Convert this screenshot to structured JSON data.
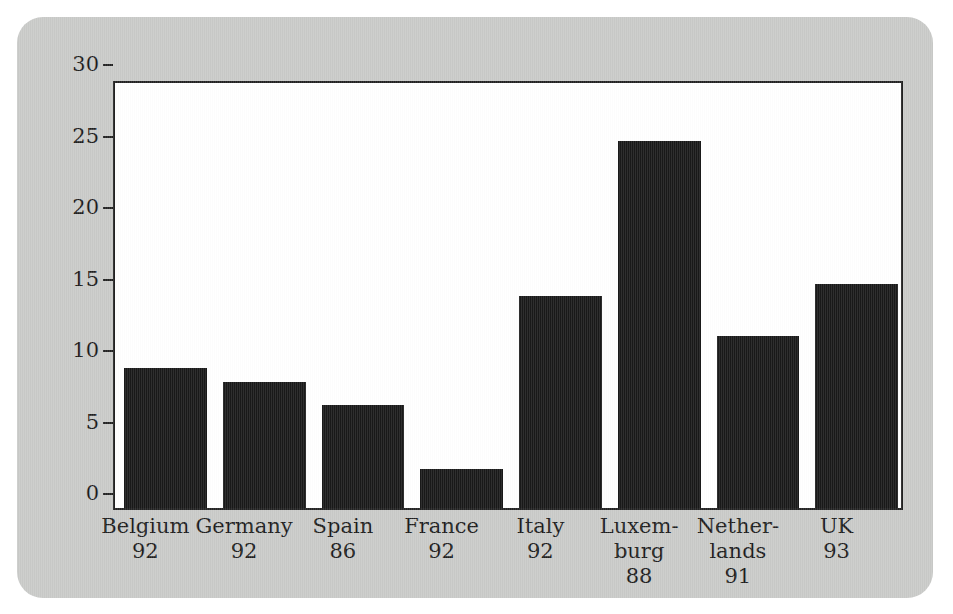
{
  "chart_data": {
    "type": "bar",
    "title": "",
    "xlabel": "",
    "ylabel": "",
    "ylim": [
      0,
      30
    ],
    "yticks": [
      0,
      5,
      10,
      15,
      20,
      25,
      30
    ],
    "grid": false,
    "legend": "none",
    "categories": [
      "Belgium\n92",
      "Germany\n92",
      "Spain\n86",
      "France\n92",
      "Italy\n92",
      "Luxem-\nburg\n88",
      "Nether-\nlands\n91",
      "UK\n93"
    ],
    "category_names": [
      "Belgium",
      "Germany",
      "Spain",
      "France",
      "Italy",
      "Luxembourg",
      "Netherlands",
      "UK"
    ],
    "category_years": [
      "92",
      "92",
      "86",
      "92",
      "92",
      "88",
      "91",
      "93"
    ],
    "values": [
      9.8,
      8.8,
      7.2,
      2.7,
      14.8,
      25.7,
      12.0,
      15.7
    ]
  },
  "style": {
    "panel_color": "#c9cac8",
    "plot_background": "#ffffff",
    "bar_color": "#191919",
    "axis_color": "#222222",
    "text_color": "#1d1d1d"
  }
}
